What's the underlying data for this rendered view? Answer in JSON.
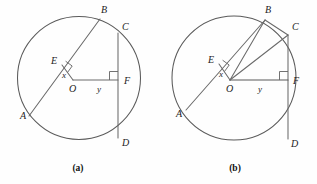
{
  "figure": {
    "background_color": "#fefefe",
    "line_color": "#6a6a6a",
    "label_color": "#1c1c1c",
    "panels": [
      {
        "id": "a",
        "caption": "(a)",
        "caption_x": 78,
        "caption_y": 171,
        "circle": {
          "cx": 79,
          "cy": 78,
          "r": 61.5
        },
        "points": {
          "A": {
            "x": 29,
            "y": 116,
            "label": "A",
            "label_x": 20,
            "label_y": 119
          },
          "B": {
            "x": 100,
            "y": 19,
            "label": "B",
            "label_x": 101,
            "label_y": 13
          },
          "C": {
            "x": 118,
            "y": 33,
            "label": "C",
            "label_x": 122,
            "label_y": 30
          },
          "D": {
            "x": 118,
            "y": 138,
            "label": "D",
            "label_x": 122,
            "label_y": 146
          },
          "E": {
            "x": 62,
            "y": 65,
            "label": "E",
            "label_x": 51,
            "label_y": 64
          },
          "F": {
            "x": 118,
            "y": 80,
            "label": "F",
            "label_x": 124,
            "label_y": 84
          },
          "O": {
            "x": 73,
            "y": 80,
            "label": "O",
            "label_x": 69,
            "label_y": 92
          }
        },
        "measures": {
          "x": {
            "label": "x",
            "x": 62,
            "y": 78
          },
          "y": {
            "label": "y",
            "x": 97,
            "y": 92
          }
        },
        "segments": [
          {
            "name": "chord-AB",
            "from": "A",
            "to": "B"
          },
          {
            "name": "chord-CD",
            "from": "C",
            "to": "D"
          },
          {
            "name": "radius-OE",
            "from": "O",
            "to": "E"
          },
          {
            "name": "segment-OF",
            "from": "O",
            "to": "F"
          }
        ],
        "right_angles": [
          {
            "name": "right-angle-at-E",
            "vertex_x": 62,
            "vertex_y": 65
          },
          {
            "name": "right-angle-at-F",
            "vertex_x": 118,
            "vertex_y": 80
          }
        ]
      },
      {
        "id": "b",
        "caption": "(b)",
        "caption_x": 235,
        "caption_y": 171,
        "circle": {
          "cx": 234,
          "cy": 78,
          "r": 62
        },
        "points": {
          "A": {
            "x": 186,
            "y": 110,
            "label": "A",
            "label_x": 176,
            "label_y": 117
          },
          "B": {
            "x": 265,
            "y": 20,
            "label": "B",
            "label_x": 265,
            "label_y": 13
          },
          "C": {
            "x": 288,
            "y": 35,
            "label": "C",
            "label_x": 292,
            "label_y": 30
          },
          "D": {
            "x": 288,
            "y": 139,
            "label": "D",
            "label_x": 291,
            "label_y": 147
          },
          "E": {
            "x": 219,
            "y": 64,
            "label": "E",
            "label_x": 208,
            "label_y": 63
          },
          "F": {
            "x": 288,
            "y": 80,
            "label": "F",
            "label_x": 293,
            "label_y": 84
          },
          "O": {
            "x": 230,
            "y": 80,
            "label": "O",
            "label_x": 226,
            "label_y": 92
          }
        },
        "measures": {
          "x": {
            "label": "x",
            "x": 219,
            "y": 77
          },
          "y": {
            "label": "y",
            "x": 258,
            "y": 92
          }
        },
        "segments": [
          {
            "name": "chord-AB",
            "from": "A",
            "to": "B"
          },
          {
            "name": "chord-CD",
            "from": "C",
            "to": "D"
          },
          {
            "name": "radius-OE",
            "from": "O",
            "to": "E"
          },
          {
            "name": "segment-OF",
            "from": "O",
            "to": "F"
          },
          {
            "name": "radius-OB",
            "from": "O",
            "to": "B"
          },
          {
            "name": "radius-OC",
            "from": "O",
            "to": "C"
          },
          {
            "name": "chord-BC",
            "from": "B",
            "to": "C"
          }
        ],
        "right_angles": [
          {
            "name": "right-angle-at-E",
            "vertex_x": 219,
            "vertex_y": 64
          },
          {
            "name": "right-angle-at-F",
            "vertex_x": 288,
            "vertex_y": 80
          }
        ]
      }
    ]
  }
}
